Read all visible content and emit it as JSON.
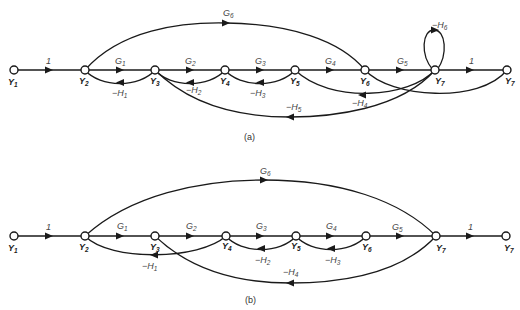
{
  "figure_a": {
    "caption": "(a)",
    "nodes": [
      "Y1",
      "Y2",
      "Y3",
      "Y4",
      "Y5",
      "Y6",
      "Y7",
      "Y7"
    ],
    "forward_gains": [
      "1",
      "G1",
      "G2",
      "G3",
      "G4",
      "G5",
      "1"
    ],
    "feedforward": "G6",
    "feedback": [
      "-H1",
      "-H2",
      "-H3",
      "-H4",
      "-H5",
      "-H6"
    ]
  },
  "figure_b": {
    "caption": "(b)",
    "nodes": [
      "Y1",
      "Y2",
      "Y3",
      "Y4",
      "Y5",
      "Y6",
      "Y7",
      "Y7"
    ],
    "forward_gains": [
      "1",
      "G1",
      "G2",
      "G3",
      "G4",
      "G5",
      "1"
    ],
    "feedforward": "G6",
    "feedback": [
      "-H1",
      "-H2",
      "-H3",
      "-H4"
    ]
  },
  "labels": {
    "Y": "Y",
    "G": "G",
    "H": "−H",
    "one": "1",
    "a": {
      "n1": "1",
      "n2": "2",
      "n3": "3",
      "n4": "4",
      "n5": "5",
      "n6": "6",
      "n7": "7",
      "n8": "7",
      "g1": "1",
      "g2": "2",
      "g3": "3",
      "g4": "4",
      "g5": "5",
      "g6": "6",
      "h1": "1",
      "h2": "2",
      "h3": "3",
      "h4": "4",
      "h5": "5",
      "h6": "6"
    },
    "b": {
      "n1": "1",
      "n2": "2",
      "n3": "3",
      "n4": "4",
      "n5": "5",
      "n6": "6",
      "n7": "7",
      "n8": "7",
      "g1": "1",
      "g2": "2",
      "g3": "3",
      "g4": "4",
      "g5": "5",
      "g6": "6",
      "h1": "1",
      "h2": "2",
      "h3": "3",
      "h4": "4"
    }
  }
}
